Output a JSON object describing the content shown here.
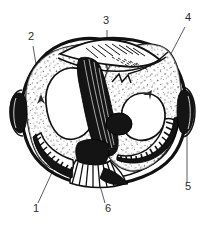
{
  "figure": {
    "kind": "anatomical-cross-section-line-drawing",
    "style": "black-and-white stippled ink illustration",
    "background_color": "#ffffff",
    "ink_color": "#111111",
    "leader_color": "#4a4a4a",
    "width": 204,
    "height": 229,
    "labels": [
      {
        "id": "label-1",
        "text": "1",
        "x": 36,
        "y": 212,
        "anchor": "middle"
      },
      {
        "id": "label-2",
        "text": "2",
        "x": 31,
        "y": 40,
        "anchor": "middle"
      },
      {
        "id": "label-3",
        "text": "3",
        "x": 106,
        "y": 24,
        "anchor": "middle"
      },
      {
        "id": "label-4",
        "text": "4",
        "x": 188,
        "y": 21,
        "anchor": "middle"
      },
      {
        "id": "label-5",
        "text": "5",
        "x": 188,
        "y": 190,
        "anchor": "middle"
      },
      {
        "id": "label-6",
        "text": "6",
        "x": 108,
        "y": 212,
        "anchor": "middle"
      }
    ],
    "leaders": [
      {
        "id": "leader-1",
        "from_label": "1",
        "path": "M 38 203 L 60 155"
      },
      {
        "id": "leader-2",
        "from_label": "2",
        "path": "M 33 46 L 41 94"
      },
      {
        "id": "leader-3",
        "from_label": "3",
        "path": "M 107 30 L 107 88"
      },
      {
        "id": "leader-4",
        "from_label": "4",
        "path": "M 185 27 L 152 90"
      },
      {
        "id": "leader-5",
        "from_label": "5",
        "path": "M 187 183 L 187 132"
      },
      {
        "id": "leader-6",
        "from_label": "6",
        "path": "M 105 203 L 96 172"
      }
    ]
  }
}
